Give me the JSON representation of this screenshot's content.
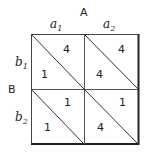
{
  "player_a": {
    "label": "A",
    "strategies": [
      "a",
      "a"
    ],
    "subscripts": [
      "1",
      "2"
    ]
  },
  "player_b": {
    "label": "B",
    "strategies": [
      "b",
      "b"
    ],
    "subscripts": [
      "1",
      "2"
    ]
  },
  "cells": [
    {
      "row": "b1",
      "col": "a1",
      "upper": "4",
      "lower": "1"
    },
    {
      "row": "b1",
      "col": "a2",
      "upper": "4",
      "lower": "4"
    },
    {
      "row": "b2",
      "col": "a1",
      "upper": "1",
      "lower": "1"
    },
    {
      "row": "b2",
      "col": "a2",
      "upper": "1",
      "lower": "4"
    }
  ]
}
